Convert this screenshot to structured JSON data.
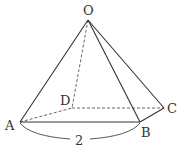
{
  "figure": {
    "type": "square pyramid",
    "vertices": {
      "O": {
        "label": "O",
        "x": 88,
        "y": 20
      },
      "A": {
        "label": "A",
        "x": 20,
        "y": 122
      },
      "B": {
        "label": "B",
        "x": 140,
        "y": 122
      },
      "C": {
        "label": "C",
        "x": 164,
        "y": 108
      },
      "D": {
        "label": "D",
        "x": 72,
        "y": 108
      }
    },
    "solid_edges": [
      "OA",
      "OB",
      "OC",
      "AB",
      "BC"
    ],
    "dashed_edges": [
      "OD",
      "AD",
      "DC"
    ],
    "dimension": {
      "edge": "AB",
      "label": "2"
    },
    "colors": {
      "line": "#333333",
      "background": "#ffffff"
    }
  }
}
